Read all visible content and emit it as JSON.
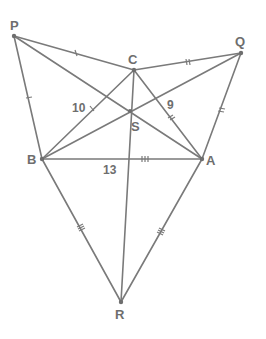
{
  "diagram": {
    "points": {
      "P": {
        "label": "P",
        "x": 14,
        "y": 36
      },
      "C": {
        "label": "C",
        "x": 134,
        "y": 70
      },
      "Q": {
        "label": "Q",
        "x": 241,
        "y": 53
      },
      "S": {
        "label": "S",
        "x": 130,
        "y": 111
      },
      "B": {
        "label": "B",
        "x": 42,
        "y": 159
      },
      "A": {
        "label": "A",
        "x": 202,
        "y": 159
      },
      "R": {
        "label": "R",
        "x": 121,
        "y": 302
      }
    },
    "edges": [
      [
        "P",
        "C"
      ],
      [
        "P",
        "B"
      ],
      [
        "P",
        "A"
      ],
      [
        "C",
        "Q"
      ],
      [
        "Q",
        "A"
      ],
      [
        "Q",
        "B"
      ],
      [
        "B",
        "A"
      ],
      [
        "B",
        "R"
      ],
      [
        "A",
        "R"
      ],
      [
        "C",
        "R"
      ],
      [
        "C",
        "B"
      ],
      [
        "C",
        "A"
      ]
    ],
    "side_lengths": {
      "BC": "10",
      "CA": "9",
      "AB": "13"
    },
    "colors": {
      "line": "#7a7a7a",
      "text": "#6e6e6e",
      "background": "#ffffff"
    }
  }
}
